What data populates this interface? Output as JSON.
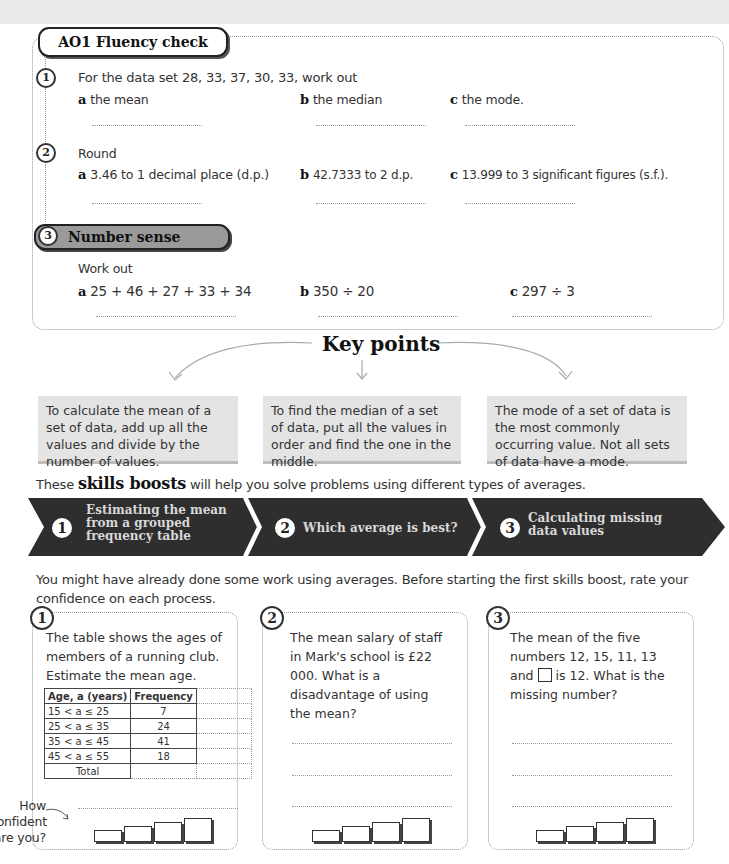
{
  "fluency": {
    "title": "AO1 Fluency check",
    "q1": {
      "num": "1",
      "prompt": "For the data set 28, 33, 37, 30, 33, work out",
      "parts": [
        {
          "label": "a",
          "text": "the mean"
        },
        {
          "label": "b",
          "text": "the median"
        },
        {
          "label": "c",
          "text": "the mode."
        }
      ]
    },
    "q2": {
      "num": "2",
      "prompt": "Round",
      "parts": [
        {
          "label": "a",
          "text": "3.46 to 1 decimal place (d.p.)"
        },
        {
          "label": "b",
          "text": "42.7333 to 2 d.p."
        },
        {
          "label": "c",
          "text": "13.999 to 3 significant figures (s.f.)."
        }
      ]
    },
    "q3": {
      "num": "3",
      "title": "Number sense",
      "prompt": "Work out",
      "parts": [
        {
          "label": "a",
          "text": "25 + 46 + 27 + 33 + 34"
        },
        {
          "label": "b",
          "text": "350 ÷ 20"
        },
        {
          "label": "c",
          "text": "297 ÷ 3"
        }
      ]
    }
  },
  "key_points": {
    "title": "Key points",
    "items": [
      "To calculate the mean of a set of data, add up all the values and divide by the number of values.",
      "To find the median of a set of data, put all the values in order and find the one in the middle.",
      "The mode of a set of data is the most commonly occurring value. Not all sets of data have a mode."
    ]
  },
  "skills": {
    "intro_before": "These",
    "intro_bold": "skills boosts",
    "intro_after": "will help you solve problems using different types of averages.",
    "segments": [
      {
        "num": "1",
        "label": "Estimating the mean from a grouped frequency table"
      },
      {
        "num": "2",
        "label": "Which average is best?"
      },
      {
        "num": "3",
        "label": "Calculating missing data values"
      }
    ],
    "colors": {
      "banner": "#2e2e2e",
      "text": "#d8d8d8"
    }
  },
  "rate_intro": "You might have already done some work using averages. Before starting the first skills boost, rate your confidence on each process.",
  "cards": [
    {
      "num": "1",
      "text": "The table shows the ages of members of a running club. Estimate the mean age.",
      "table": {
        "headers": [
          "Age, a (years)",
          "Frequency"
        ],
        "rows": [
          [
            "15 < a ≤ 25",
            "7"
          ],
          [
            "25 < a ≤ 35",
            "24"
          ],
          [
            "35 < a ≤ 45",
            "41"
          ],
          [
            "45 < a ≤ 55",
            "18"
          ]
        ],
        "total_label": "Total"
      }
    },
    {
      "num": "2",
      "text": "The mean salary of staff in Mark's school is £22 000. What is a disadvantage of using the mean?"
    },
    {
      "num": "3",
      "text_before": "The mean of the five numbers 12, 15, 11, 13 and",
      "text_after": "is 12. What is the missing number?"
    }
  ],
  "confidence_label": "How confident are you?"
}
